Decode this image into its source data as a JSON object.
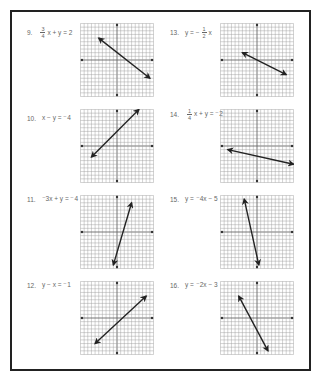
{
  "worksheet": {
    "problems": [
      {
        "number": "9.",
        "equation": {
          "pre": "",
          "frac_num": "3",
          "frac_den": "4",
          "post": "x + y = 2"
        },
        "column": "left",
        "row": 0,
        "line": {
          "x1": -5,
          "y1": 6,
          "x2": 9,
          "y2": -5
        }
      },
      {
        "number": "13.",
        "equation": {
          "pre": "y = −",
          "frac_num": "1",
          "frac_den": "2",
          "post": "x"
        },
        "column": "right",
        "row": 0,
        "line": {
          "x1": -4,
          "y1": 2,
          "x2": 8,
          "y2": -4
        }
      },
      {
        "number": "10.",
        "equation": {
          "pre": "x − y = ⁻4",
          "frac_num": "",
          "frac_den": "",
          "post": ""
        },
        "column": "left",
        "row": 1,
        "line": {
          "x1": -7,
          "y1": -3,
          "x2": 6,
          "y2": 10
        }
      },
      {
        "number": "14.",
        "equation": {
          "pre": "",
          "frac_num": "1",
          "frac_den": "4",
          "post": "x + y = ⁻2"
        },
        "column": "right",
        "row": 1,
        "line": {
          "x1": -8,
          "y1": -1,
          "x2": 10,
          "y2": -5
        }
      },
      {
        "number": "11.",
        "equation": {
          "pre": "⁻3x + y = ⁻4",
          "frac_num": "",
          "frac_den": "",
          "post": ""
        },
        "column": "left",
        "row": 2,
        "line": {
          "x1": -1,
          "y1": -9,
          "x2": 4,
          "y2": 8
        }
      },
      {
        "number": "15.",
        "equation": {
          "pre": "y = ⁻4x − 5",
          "frac_num": "",
          "frac_den": "",
          "post": ""
        },
        "column": "right",
        "row": 2,
        "line": {
          "x1": -3.5,
          "y1": 9,
          "x2": 0.5,
          "y2": -9
        }
      },
      {
        "number": "12.",
        "equation": {
          "pre": "y − x = ⁻1",
          "frac_num": "",
          "frac_den": "",
          "post": ""
        },
        "column": "left",
        "row": 3,
        "line": {
          "x1": -6,
          "y1": -7,
          "x2": 8,
          "y2": 6
        }
      },
      {
        "number": "16.",
        "equation": {
          "pre": "y = ⁻2x − 3",
          "frac_num": "",
          "frac_den": "",
          "post": ""
        },
        "column": "right",
        "row": 3,
        "line": {
          "x1": -5,
          "y1": 6,
          "x2": 3,
          "y2": -9
        }
      }
    ],
    "grid": {
      "range": [
        -10,
        10
      ],
      "cells": 20,
      "line_color": "#9a9a9a",
      "axis_color": "#666666",
      "graph_line_color": "#222222"
    }
  }
}
